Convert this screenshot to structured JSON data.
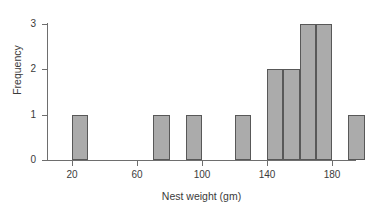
{
  "chart_data": {
    "type": "bar",
    "title": "",
    "subtitle": "",
    "xlabel": "Nest weight (gm)",
    "ylabel": "Frequency",
    "xlim": [
      13,
      203
    ],
    "ylim": [
      0,
      3.1
    ],
    "grid": false,
    "legend": null,
    "bin_width": 10,
    "x_ticks": [
      20,
      60,
      100,
      140,
      180
    ],
    "x_tick_labels": [
      "20",
      "60",
      "100",
      "140",
      "180"
    ],
    "y_ticks": [
      0,
      1,
      2,
      3
    ],
    "y_tick_labels": [
      "0",
      "1",
      "2",
      "3"
    ],
    "bars": [
      {
        "bin_start": 20,
        "bin_end": 30,
        "value": 1
      },
      {
        "bin_start": 70,
        "bin_end": 80,
        "value": 1
      },
      {
        "bin_start": 90,
        "bin_end": 100,
        "value": 1
      },
      {
        "bin_start": 120,
        "bin_end": 130,
        "value": 1
      },
      {
        "bin_start": 140,
        "bin_end": 150,
        "value": 2
      },
      {
        "bin_start": 150,
        "bin_end": 160,
        "value": 2
      },
      {
        "bin_start": 160,
        "bin_end": 170,
        "value": 3
      },
      {
        "bin_start": 170,
        "bin_end": 180,
        "value": 3
      },
      {
        "bin_start": 190,
        "bin_end": 200,
        "value": 1
      }
    ],
    "categories": [
      "20-30",
      "70-80",
      "90-100",
      "120-130",
      "140-150",
      "150-160",
      "160-170",
      "170-180",
      "190-200"
    ],
    "values": [
      1,
      1,
      1,
      1,
      2,
      2,
      3,
      3,
      1
    ],
    "colors": {
      "bar_fill": "#ababab",
      "bar_stroke": "#585858",
      "axis": "#6e6e6e",
      "text": "#3b3b3b",
      "background": "#ffffff"
    }
  }
}
